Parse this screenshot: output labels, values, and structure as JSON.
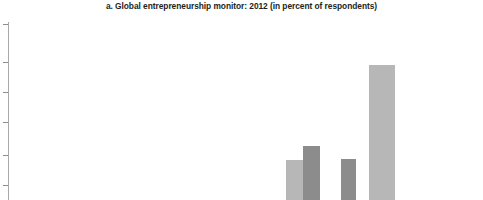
{
  "figure": {
    "panel_label": "a.",
    "title": "a. Global entrepreneurship monitor: 2012 (in percent of respondents)"
  },
  "colors": {
    "series_light": "#b7b7b7",
    "series_dark": "#8c8c8c",
    "axis": "#a8a8a8",
    "text": "#231f20",
    "background": "#ffffff"
  },
  "chart_data": {
    "type": "bar",
    "title": "a. Global entrepreneurship monitor: 2012 (in percent of respondents)",
    "xlabel": "",
    "ylabel": "",
    "ylim": [
      0,
      30
    ],
    "grid": false,
    "legend_position": "none",
    "note": "Cropped panel; category axis labels and y tick labels fall outside the visible crop.",
    "axis": {
      "y_tick_pixel_positions_from_plot_top": [
        2,
        40,
        70,
        100,
        133,
        163
      ],
      "y_tick_labels_visible": false,
      "x_tick_labels_visible": false
    },
    "categories": [
      "C1",
      "C2",
      "C3",
      "C4",
      "C5",
      "C6",
      "C7",
      "C8"
    ],
    "series": [
      {
        "name": "Series light",
        "color": "#b7b7b7",
        "values": [
          0,
          0,
          2.4,
          7.0,
          0,
          24.0,
          0,
          3.5
        ]
      },
      {
        "name": "Series dark",
        "color": "#8c8c8c",
        "values": [
          0,
          2.0,
          0.9,
          9.6,
          8.4,
          0,
          3.4,
          0
        ]
      }
    ],
    "bars": [
      {
        "index": 0,
        "series": "dark",
        "x": 140,
        "width": 16,
        "top": 188,
        "value": 2.0
      },
      {
        "index": 1,
        "series": "light",
        "x": 206,
        "width": 15,
        "top": 186,
        "value": 2.4
      },
      {
        "index": 2,
        "series": "dark",
        "x": 221,
        "width": 10,
        "top": 193,
        "value": 0.9
      },
      {
        "index": 3,
        "series": "light",
        "x": 286,
        "width": 17,
        "top": 138,
        "value": 7.0
      },
      {
        "index": 4,
        "series": "dark",
        "x": 303,
        "width": 17,
        "top": 124,
        "value": 9.6
      },
      {
        "index": 5,
        "series": "dark",
        "x": 341,
        "width": 15,
        "top": 137,
        "value": 8.4
      },
      {
        "index": 6,
        "series": "light",
        "x": 369,
        "width": 26,
        "top": 43,
        "value": 24.0
      },
      {
        "index": 7,
        "series": "dark",
        "x": 390,
        "width": 16,
        "top": 181,
        "value": 3.4
      },
      {
        "index": 8,
        "series": "light",
        "x": 448,
        "width": 14,
        "top": 180,
        "value": 3.5
      }
    ]
  }
}
